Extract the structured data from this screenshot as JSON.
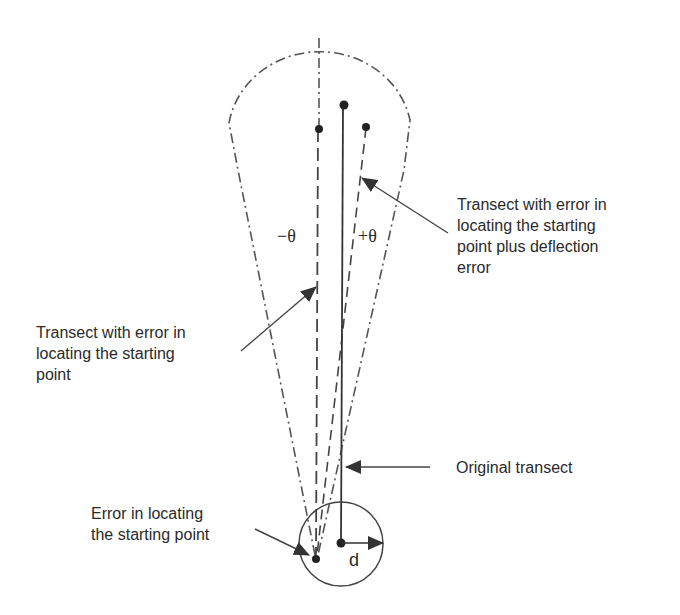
{
  "diagram": {
    "type": "transect-error-schematic",
    "colors": {
      "stroke": "#444444",
      "text": "#2a2a2a",
      "background": "#ffffff"
    },
    "labels": {
      "minus_theta": "−θ",
      "plus_theta": "+θ",
      "distance": "d"
    },
    "annotations": [
      {
        "id": "deflection",
        "lines": [
          "Transect with error in",
          "locating the starting",
          "point plus deflection",
          "error"
        ]
      },
      {
        "id": "start_error_transect",
        "lines": [
          "Transect with error in",
          "locating the starting",
          "point"
        ]
      },
      {
        "id": "original",
        "lines": [
          "Original transect"
        ]
      },
      {
        "id": "start_error",
        "lines": [
          "Error in locating",
          "the starting point"
        ]
      }
    ],
    "elements": {
      "original_transect": "solid line",
      "shifted_transect": "dashed line",
      "deflected_transect": "dashed line",
      "error_cone": "dash-dot outline",
      "error_circle": "solid circle of radius d"
    }
  }
}
